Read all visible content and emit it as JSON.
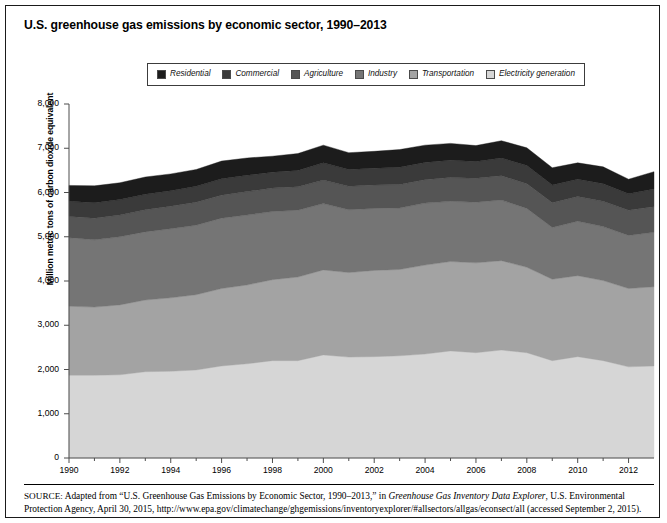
{
  "figure": {
    "title": "U.S. greenhouse gas emissions by economic sector, 1990–2013"
  },
  "legend": {
    "items": [
      {
        "label": "Residential",
        "color": "#1c1c1c",
        "icon": "legend-swatch-icon"
      },
      {
        "label": "Commercial",
        "color": "#3a3a3a",
        "icon": "legend-swatch-icon"
      },
      {
        "label": "Agriculture",
        "color": "#555555",
        "icon": "legend-swatch-icon"
      },
      {
        "label": "Industry",
        "color": "#757575",
        "icon": "legend-swatch-icon"
      },
      {
        "label": "Transportation",
        "color": "#a3a3a3",
        "icon": "legend-swatch-icon"
      },
      {
        "label": "Electricity generation",
        "color": "#d6d6d6",
        "icon": "legend-swatch-icon"
      }
    ]
  },
  "source": {
    "prefix": "SOURCE:",
    "line1_a": " Adapted from “U.S. Greenhouse Gas Emissions by Economic Sector, 1990–2013,” in ",
    "line1_italic": "Greenhouse Gas Inventory Data Explorer",
    "line1_b": ", U.S. Environmental Protection Agency, April 30, 2015, http://www.epa.gov/climatechange/ghgemissions/inventoryexplorer/#allsectors/allgas/econsect/all (accessed September 2, 2015)."
  },
  "chart_data": {
    "type": "area",
    "title": "U.S. greenhouse gas emissions by economic sector, 1990–2013",
    "xlabel": "",
    "ylabel": "Million metric tons of carbon dioxide equivalent",
    "stacked": true,
    "grid": false,
    "legend_position": "top",
    "xlim": [
      1990,
      2013
    ],
    "ylim": [
      0,
      8000
    ],
    "yticks": [
      0,
      1000,
      2000,
      3000,
      4000,
      5000,
      6000,
      7000,
      8000
    ],
    "ytick_labels": [
      "0",
      "1,000",
      "2,000",
      "3,000",
      "4,000",
      "5,000",
      "6,000",
      "7,000",
      "8,000"
    ],
    "xticks": [
      1990,
      1992,
      1994,
      1996,
      1998,
      2000,
      2002,
      2004,
      2006,
      2008,
      2010,
      2012
    ],
    "xtick_labels": [
      "1990",
      "1992",
      "1994",
      "1996",
      "1998",
      "2000",
      "2002",
      "2004",
      "2006",
      "2008",
      "2010",
      "2012"
    ],
    "x": [
      1990,
      1991,
      1992,
      1993,
      1994,
      1995,
      1996,
      1997,
      1998,
      1999,
      2000,
      2001,
      2002,
      2003,
      2004,
      2005,
      2006,
      2007,
      2008,
      2009,
      2010,
      2011,
      2012,
      2013
    ],
    "series": [
      {
        "name": "Electricity generation",
        "color": "#d6d6d6",
        "values": [
          1870,
          1870,
          1880,
          1950,
          1960,
          1990,
          2080,
          2130,
          2200,
          2200,
          2330,
          2280,
          2290,
          2310,
          2350,
          2420,
          2380,
          2440,
          2380,
          2200,
          2290,
          2200,
          2060,
          2080
        ]
      },
      {
        "name": "Transportation",
        "color": "#a3a3a3",
        "values": [
          1560,
          1540,
          1580,
          1620,
          1660,
          1700,
          1750,
          1780,
          1830,
          1890,
          1920,
          1910,
          1950,
          1950,
          2010,
          2020,
          2030,
          2020,
          1930,
          1840,
          1830,
          1810,
          1770,
          1790
        ]
      },
      {
        "name": "Industry",
        "color": "#757575",
        "values": [
          1550,
          1520,
          1540,
          1540,
          1560,
          1570,
          1590,
          1580,
          1540,
          1510,
          1500,
          1420,
          1400,
          1390,
          1400,
          1360,
          1370,
          1370,
          1330,
          1170,
          1230,
          1220,
          1200,
          1230
        ]
      },
      {
        "name": "Agriculture",
        "color": "#555555",
        "values": [
          480,
          490,
          490,
          500,
          510,
          520,
          520,
          530,
          530,
          530,
          530,
          530,
          530,
          530,
          530,
          540,
          540,
          550,
          560,
          560,
          560,
          570,
          570,
          580
        ]
      },
      {
        "name": "Commercial",
        "color": "#3a3a3a",
        "values": [
          340,
          350,
          350,
          350,
          350,
          360,
          370,
          370,
          360,
          370,
          390,
          380,
          380,
          390,
          390,
          390,
          380,
          400,
          410,
          400,
          390,
          400,
          370,
          400
        ]
      },
      {
        "name": "Residential",
        "color": "#1c1c1c",
        "values": [
          360,
          380,
          380,
          390,
          380,
          380,
          400,
          390,
          360,
          380,
          400,
          380,
          380,
          400,
          390,
          380,
          360,
          390,
          400,
          390,
          370,
          380,
          330,
          390
        ]
      }
    ],
    "totals": [
      6160,
      6150,
      6220,
      6350,
      6420,
      6520,
      6710,
      6780,
      6820,
      6880,
      7070,
      6900,
      6930,
      6970,
      7070,
      7110,
      7060,
      7170,
      7010,
      6560,
      6670,
      6580,
      6300,
      6470
    ]
  }
}
